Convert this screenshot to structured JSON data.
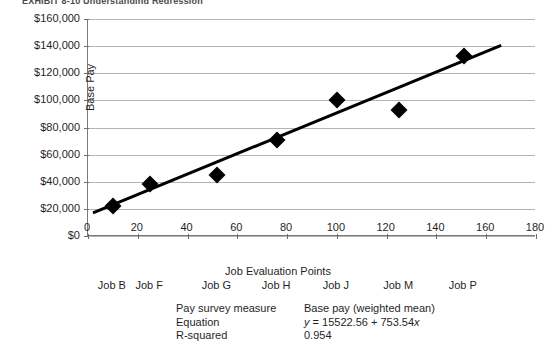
{
  "exhibit": {
    "title": "EXHIBIT 8-10    Understanding Regression"
  },
  "chart_data": {
    "type": "scatter",
    "title": "",
    "xlabel": "Job Evaluation Points",
    "ylabel": "Base Pay",
    "xlim": [
      0,
      180
    ],
    "ylim": [
      0,
      160000
    ],
    "xticks": [
      "0",
      "20",
      "40",
      "60",
      "80",
      "100",
      "120",
      "140",
      "160",
      "180"
    ],
    "xtick_values": [
      0,
      20,
      40,
      60,
      80,
      100,
      120,
      140,
      160,
      180
    ],
    "yticks": [
      "$0",
      "$20,000",
      "$40,000",
      "$60,000",
      "$80,000",
      "$100,000",
      "$120,000",
      "$140,000",
      "$160,000"
    ],
    "ytick_values": [
      0,
      20000,
      40000,
      60000,
      80000,
      100000,
      120000,
      140000,
      160000
    ],
    "grid": true,
    "legend": "none",
    "marker": "diamond",
    "marker_color": "#000000",
    "points": [
      {
        "label": "Job B",
        "x": 10,
        "y": 22000
      },
      {
        "label": "Job F",
        "x": 25,
        "y": 38000
      },
      {
        "label": "Job G",
        "x": 52,
        "y": 45000
      },
      {
        "label": "Job H",
        "x": 76,
        "y": 71000
      },
      {
        "label": "Job J",
        "x": 100,
        "y": 100000
      },
      {
        "label": "Job M",
        "x": 125,
        "y": 93000
      },
      {
        "label": "Job P",
        "x": 151,
        "y": 133000
      }
    ],
    "job_labels": [
      "Job B",
      "Job F",
      "Job G",
      "Job H",
      "Job J",
      "Job M",
      "Job P"
    ],
    "trendline": {
      "intercept": 15522.56,
      "slope": 753.54,
      "x_start": 2,
      "x_end": 166,
      "color": "#000000"
    }
  },
  "footer": {
    "rows": [
      {
        "key": "Pay survey measure",
        "value": "Base pay (weighted mean)"
      },
      {
        "key": "Equation",
        "value": "y = 15522.56 + 753.54x"
      },
      {
        "key": "R-squared",
        "value": "0.954"
      }
    ]
  }
}
